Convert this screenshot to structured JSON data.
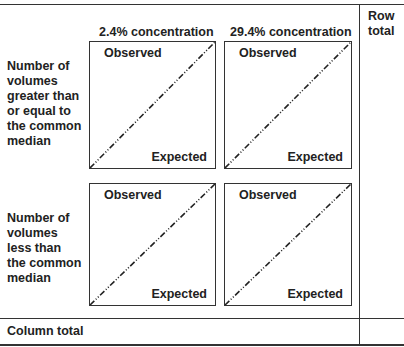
{
  "columns": {
    "col1": "2.4% concentration",
    "col2": "29.4% concentration",
    "row_total": [
      "Row",
      "total"
    ]
  },
  "rows": {
    "row1": [
      "Number of",
      "volumes",
      "greater than",
      "or equal to",
      "the common",
      "median"
    ],
    "row2": [
      "Number of",
      "volumes",
      "less than",
      "the common",
      "median"
    ],
    "column_total": "Column total"
  },
  "cells": {
    "observed_label": "Observed",
    "expected_label": "Expected"
  },
  "line_style": "dash-dot diagonal (expected = observed reference line)"
}
